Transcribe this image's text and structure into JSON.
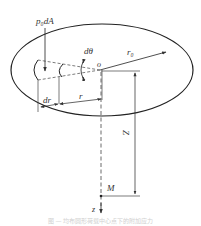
{
  "diagram": {
    "type": "physics-schematic",
    "labels": {
      "load": "p₀dA",
      "angle": "dθ",
      "origin": "o",
      "radius_outer": "r₀",
      "radius": "r",
      "radius_increment": "dr",
      "depth": "Z",
      "point": "M",
      "axis": "z"
    },
    "caption": "图 — 均布圆形荷载中心点下的附加应力"
  }
}
